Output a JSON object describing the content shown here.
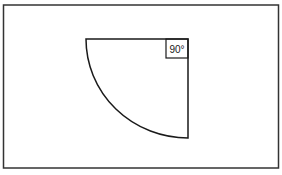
{
  "diagram": {
    "angle_label": "90°",
    "colors": {
      "stroke": "#1a1a1a",
      "background": "#ffffff",
      "frame": "#333333"
    }
  }
}
